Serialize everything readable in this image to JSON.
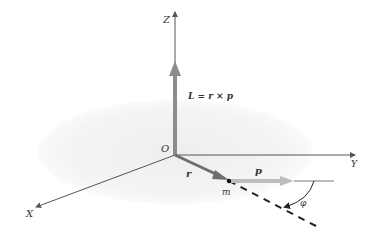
{
  "diagram": {
    "axes": {
      "z_label": "Z",
      "y_label": "Y",
      "x_label": "X",
      "origin_label": "O"
    },
    "vectors": {
      "angular_momentum_label": "L = r × p",
      "position_label": "r",
      "momentum_label": "p"
    },
    "point": {
      "mass_label": "m"
    },
    "angle": {
      "label": "φ"
    },
    "colors": {
      "axis": "#555555",
      "vector_L": "#8c8c8c",
      "vector_r": "#6e6e6e",
      "vector_p": "#bdbdbd",
      "plane": "#f2f2f2",
      "dashed_line": "#222222"
    }
  }
}
